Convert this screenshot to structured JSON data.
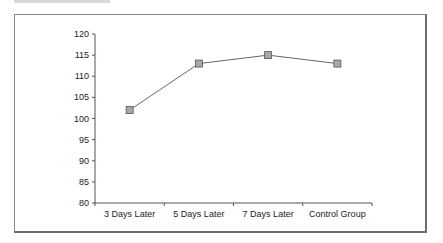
{
  "chart_data": {
    "type": "line",
    "title": "",
    "xlabel": "",
    "ylabel": "",
    "categories": [
      "3 Days Later",
      "5 Days Later",
      "7 Days Later",
      "Control Group"
    ],
    "series": [
      {
        "name": "Series 1",
        "values": [
          102,
          113,
          115,
          113
        ],
        "color": "#666666",
        "marker": "square",
        "marker_fill": "#a8a8a8"
      }
    ],
    "ylim": [
      80,
      120
    ],
    "yticks": [
      80,
      85,
      90,
      95,
      100,
      105,
      110,
      115,
      120
    ],
    "grid": false,
    "legend": "none"
  }
}
